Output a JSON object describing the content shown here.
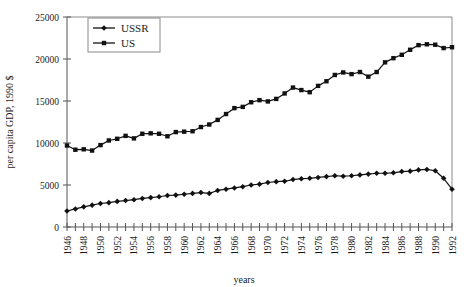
{
  "chart_data": {
    "type": "line",
    "title": "",
    "xlabel": "years",
    "ylabel": "per capita GDP, 1990 $",
    "xlim": [
      1946,
      1992
    ],
    "ylim": [
      0,
      25000
    ],
    "grid": false,
    "legend_position": "top-left",
    "y_ticks": [
      0,
      5000,
      10000,
      15000,
      20000,
      25000
    ],
    "y_tick_labels": [
      "0",
      "5000",
      "10000",
      "15000",
      "20000",
      "25000"
    ],
    "x_ticks": [
      1946,
      1947,
      1948,
      1949,
      1950,
      1951,
      1952,
      1953,
      1954,
      1955,
      1956,
      1957,
      1958,
      1959,
      1960,
      1961,
      1962,
      1963,
      1964,
      1965,
      1966,
      1967,
      1968,
      1969,
      1970,
      1971,
      1972,
      1973,
      1974,
      1975,
      1976,
      1977,
      1978,
      1979,
      1980,
      1981,
      1982,
      1983,
      1984,
      1985,
      1986,
      1987,
      1988,
      1989,
      1990,
      1991,
      1992
    ],
    "x_tick_labels": [
      "1946",
      "",
      "1948",
      "",
      "1950",
      "",
      "1952",
      "",
      "1954",
      "",
      "1956",
      "",
      "1958",
      "",
      "1960",
      "",
      "1962",
      "",
      "1964",
      "",
      "1966",
      "",
      "1968",
      "",
      "1970",
      "",
      "1972",
      "",
      "1974",
      "",
      "1976",
      "",
      "1978",
      "",
      "1980",
      "",
      "1982",
      "",
      "1984",
      "",
      "1986",
      "",
      "1988",
      "",
      "1990",
      "",
      "1992"
    ],
    "x": [
      1946,
      1947,
      1948,
      1949,
      1950,
      1951,
      1952,
      1953,
      1954,
      1955,
      1956,
      1957,
      1958,
      1959,
      1960,
      1961,
      1962,
      1963,
      1964,
      1965,
      1966,
      1967,
      1968,
      1969,
      1970,
      1971,
      1972,
      1973,
      1974,
      1975,
      1976,
      1977,
      1978,
      1979,
      1980,
      1981,
      1982,
      1983,
      1984,
      1985,
      1986,
      1987,
      1988,
      1989,
      1990,
      1991,
      1992
    ],
    "series": [
      {
        "name": "USSR",
        "marker": "diamond",
        "color": "#111111",
        "values": [
          1900,
          2150,
          2400,
          2600,
          2800,
          2900,
          3050,
          3150,
          3250,
          3400,
          3500,
          3600,
          3750,
          3800,
          3900,
          4000,
          4100,
          4000,
          4350,
          4500,
          4650,
          4800,
          5000,
          5100,
          5300,
          5400,
          5450,
          5650,
          5750,
          5800,
          5900,
          6000,
          6100,
          6050,
          6100,
          6200,
          6300,
          6400,
          6400,
          6450,
          6600,
          6650,
          6800,
          6850,
          6700,
          5800,
          4500
        ]
      },
      {
        "name": "US",
        "marker": "square",
        "color": "#111111",
        "values": [
          9700,
          9200,
          9250,
          9100,
          9750,
          10300,
          10500,
          10850,
          10550,
          11100,
          11150,
          11100,
          10800,
          11300,
          11350,
          11400,
          11900,
          12200,
          12750,
          13450,
          14150,
          14300,
          14850,
          15100,
          14950,
          15250,
          15900,
          16600,
          16300,
          16050,
          16800,
          17350,
          18100,
          18400,
          18200,
          18450,
          17900,
          18450,
          19600,
          20100,
          20500,
          21100,
          21650,
          21750,
          21700,
          21300,
          21400
        ]
      }
    ]
  }
}
